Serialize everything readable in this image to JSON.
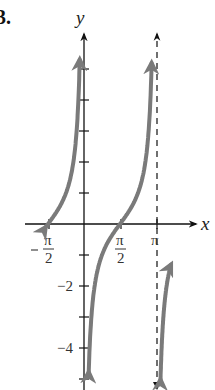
{
  "problem_number": "3.",
  "chart_data": {
    "type": "line",
    "title": "",
    "function": "y = -cot(x)",
    "xlabel": "x",
    "ylabel": "y",
    "x_ticks": [
      {
        "value": -1.5708,
        "label": "-π/2"
      },
      {
        "value": 1.5708,
        "label": "π/2"
      },
      {
        "value": 3.1416,
        "label": "π"
      }
    ],
    "y_ticks": [
      {
        "value": -2,
        "label": "−2"
      },
      {
        "value": -4,
        "label": "−4"
      }
    ],
    "y_tick_marks": [
      -5,
      -4,
      -3,
      -2,
      -1,
      1,
      2,
      3,
      4,
      5
    ],
    "vertical_asymptotes": [
      {
        "x": 0,
        "style": "axis"
      },
      {
        "x": 3.1416,
        "style": "dashed"
      }
    ],
    "zeros": [
      -1.5708,
      1.5708
    ],
    "xlim": [
      -1.65,
      3.5
    ],
    "ylim": [
      -5.3,
      6.2
    ],
    "grid": false,
    "curve_color": "#7a7a7a",
    "axis_color": "#111111",
    "pixel_scale": {
      "origin_x": 84,
      "origin_y": 224,
      "px_per_unit_y": 31,
      "px_per_half_pi_x": 36
    }
  }
}
